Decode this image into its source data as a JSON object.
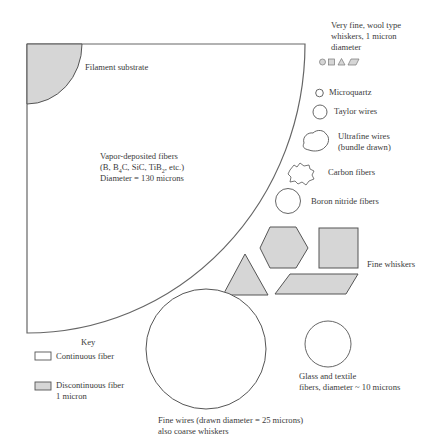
{
  "colors": {
    "stroke": "#555555",
    "fill_discontinuous": "#d6d6d6",
    "fill_continuous": "#ffffff",
    "text": "#3a3a3a"
  },
  "labels": {
    "filament_substrate": "Filament substrate",
    "vapor_deposited": {
      "line1": "Vapor-deposited fibers",
      "line2_pre": "(B, B",
      "line2_sub1": "4",
      "line2_mid": "C, SiC, TiB",
      "line2_sub2": "2",
      "line2_post": ", etc.)",
      "line3": "Diameter = 130 microns"
    },
    "very_fine": {
      "line1": "Very fine, wool type",
      "line2": "whiskers, 1 micron",
      "line3": "diameter"
    },
    "microquartz": "Microquartz",
    "taylor_wires": "Taylor wires",
    "ultrafine_wires": {
      "line1": "Ultrafine wires",
      "line2": "(bundle drawn)"
    },
    "carbon_fibers": "Carbon fibers",
    "boron_nitride": "Boron nitride fibers",
    "fine_whiskers": "Fine whiskers",
    "glass_textile": {
      "line1": "Glass and textile",
      "line2": "fibers, diameter ~ 10 microns"
    },
    "fine_wires": {
      "line1": "Fine wires (drawn diameter = 25 microns)",
      "line2": "also coarse whiskers"
    }
  },
  "key": {
    "title": "Key",
    "items": [
      {
        "label": "Continuous fiber",
        "type": "continuous"
      },
      {
        "label": "Discontinuous fiber",
        "sublabel": "1 micron",
        "type": "discontinuous"
      }
    ]
  }
}
